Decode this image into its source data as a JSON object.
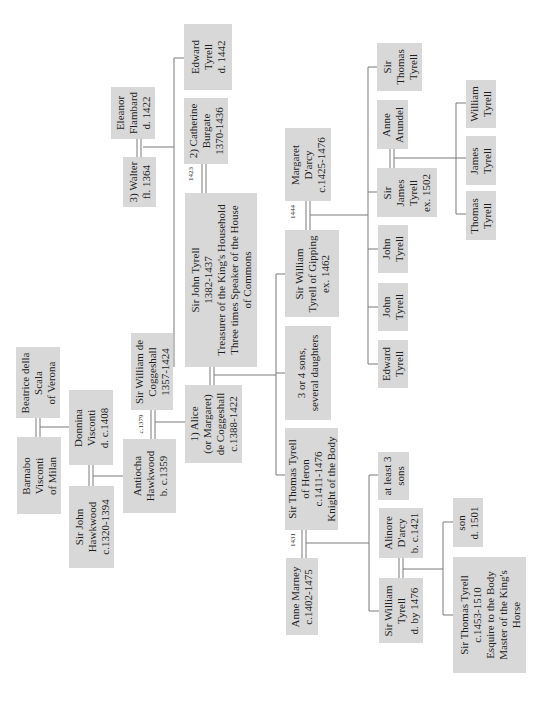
{
  "orientation": "rotated 90 degrees counter-clockwise",
  "people": {
    "edward_tyrell_1442": [
      "Edward",
      "Tyrell",
      "d. 1442"
    ],
    "eleanor_flambard": [
      "Eleanor",
      "Flambard",
      "d. 1422"
    ],
    "walter": [
      "3) Walter",
      "fl. 1364"
    ],
    "catherine_burgate": [
      "2) Catherine",
      "Burgate",
      "1370-1436"
    ],
    "sir_john_tyrell": [
      "Sir John Tyrell",
      "1382-1437",
      "Treasurer of the King's Household",
      "Three times Speaker of the House",
      "of Commons"
    ],
    "beatrice_della_scala": [
      "Beatrice della",
      "Scala",
      "of Verona"
    ],
    "barnabo_visconti": [
      "Barnabo",
      "Visconti",
      "of Milan"
    ],
    "donnina_visconti": [
      "Donnina",
      "Visconti",
      "d. c.1408"
    ],
    "sir_john_hawkwood": [
      "Sir John",
      "Hawkwood",
      "c.1320-1394"
    ],
    "antiocha_hawkwood": [
      "Antiocha",
      "Hawkwood",
      "b. c.1359"
    ],
    "sir_william_de_coggeshall": [
      "Sir William de",
      "Coggeshall",
      "1357-1424"
    ],
    "alice_coggeshall": [
      "1) Alice",
      "(or Margaret)",
      "de Coggeshall",
      "c.1388-1422"
    ],
    "margaret_darcy": [
      "Margaret",
      "D'arcy",
      "c.1425-1476"
    ],
    "sir_william_tyrell_gipping": [
      "Sir William",
      "Tyrell of Gipping",
      "ex. 1462"
    ],
    "three_or_four_sons": [
      "3 or 4 sons,",
      "several daughters"
    ],
    "sir_thomas_tyrell_heron": [
      "Sir Thomas Tyrell",
      "of Heron",
      "c.1411-1476",
      "Knight of the Body"
    ],
    "sir_thomas_tyrell_top": [
      "Sir",
      "Thomas",
      "Tyrell"
    ],
    "anne_arundel": [
      "Anne",
      "Arundel"
    ],
    "sir_james_tyrell": [
      "Sir",
      "James",
      "Tyrell",
      "ex. 1502"
    ],
    "john_tyrell_1": [
      "John",
      "Tyrell"
    ],
    "john_tyrell_2": [
      "John",
      "Tyrell"
    ],
    "edward_tyrell": [
      "Edward",
      "Tyrell"
    ],
    "william_tyrell": [
      "William",
      "Tyrell"
    ],
    "james_tyrell": [
      "James",
      "Tyrell"
    ],
    "thomas_tyrell": [
      "Thomas",
      "Tyrell"
    ],
    "anne_marney": [
      "Anne Marney",
      "c.1402-1475"
    ],
    "at_least_3_sons": [
      "at least 3",
      "sons"
    ],
    "alinore_darcy": [
      "Alinore",
      "D'arcy",
      "b. c.1421"
    ],
    "son_1501": [
      "son",
      "d. 1501"
    ],
    "sir_william_tyrell_1476": [
      "Sir William",
      "Tyrell",
      "d. by 1476"
    ],
    "sir_thomas_tyrell_1453": [
      "Sir Thomas Tyrell",
      "c.1453-1510",
      "Esquire to the Body",
      "Master of the King's",
      "Horse"
    ]
  },
  "marriage_years": {
    "walter_catherine": "1423",
    "coggeshall_antiocha": "c.1379",
    "william_margaret": "1444",
    "thomas_anne": "1431"
  }
}
